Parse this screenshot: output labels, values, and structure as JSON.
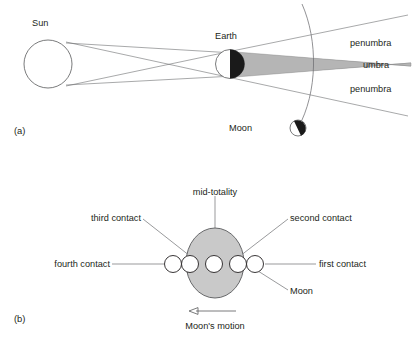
{
  "figure": {
    "panel_a": {
      "tag": "(a)",
      "labels": {
        "sun": "Sun",
        "earth": "Earth",
        "moon": "Moon",
        "penumbra_top": "penumbra",
        "umbra": "umbra",
        "penumbra_bottom": "penumbra"
      }
    },
    "panel_b": {
      "tag": "(b)",
      "labels": {
        "mid_totality": "mid-totality",
        "third_contact": "third contact",
        "second_contact": "second contact",
        "fourth_contact": "fourth contact",
        "first_contact": "first contact",
        "moon": "Moon",
        "moons_motion": "Moon's motion"
      }
    },
    "caption_partial": ""
  },
  "colors": {
    "ink": "#231f20",
    "line": "#6d6e71",
    "umbra_fill": "#b5b5b5",
    "shadow_ellipse_fill": "#c9c9c9",
    "dark_side": "#1a1a1a",
    "page_background": "#ffffff"
  }
}
